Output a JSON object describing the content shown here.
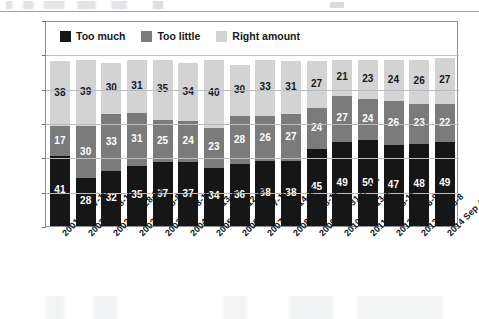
{
  "chart_data": {
    "type": "bar",
    "subtype": "stacked-bar",
    "title": "",
    "xlabel": "",
    "ylabel": "",
    "ylim": [
      0,
      120
    ],
    "yticks": [
      0,
      20,
      40,
      60,
      80,
      100,
      120
    ],
    "grid": true,
    "legend_position": "top-left-inside",
    "categories": [
      "2001 Sep 7-10",
      "2002 Feb 8-10",
      "2002 Jun 28-30",
      "2002 Sep 5-8",
      "2003 Sep 8-10",
      "2004 Sep 13-15",
      "2005 Sep 12-15",
      "2006 Sep 7-10",
      "2007 Sep 14-16",
      "2008 Sep 8-11",
      "2009 Aug 31-Sep 2",
      "2010 Sep 13-16",
      "2011 Sep 8-11",
      "2012 Sep 6-9",
      "2013 Sep 5-8",
      "2014 Sep 4-7"
    ],
    "series": [
      {
        "name": "Too much",
        "color": "#161616",
        "values": [
          41,
          28,
          32,
          35,
          37,
          37,
          34,
          36,
          38,
          38,
          45,
          49,
          50,
          47,
          48,
          49
        ]
      },
      {
        "name": "Too little",
        "color": "#7b7b7b",
        "values": [
          17,
          30,
          33,
          31,
          25,
          24,
          23,
          28,
          26,
          27,
          24,
          27,
          24,
          26,
          23,
          22
        ]
      },
      {
        "name": "Right amount",
        "color": "#d3d3d3",
        "values": [
          38,
          39,
          30,
          31,
          35,
          34,
          40,
          30,
          33,
          31,
          27,
          21,
          23,
          24,
          26,
          27
        ]
      }
    ]
  },
  "legend": {
    "items": [
      {
        "label": "Too much",
        "color": "#161616",
        "swatch": "legend-swatch-too-much"
      },
      {
        "label": "Too little",
        "color": "#7b7b7b",
        "swatch": "legend-swatch-too-little"
      },
      {
        "label": "Right amount",
        "color": "#d3d3d3",
        "swatch": "legend-swatch-right-amount"
      }
    ]
  }
}
